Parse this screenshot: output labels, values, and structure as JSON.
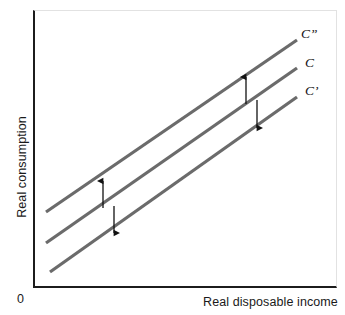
{
  "figure": {
    "origin_label": "0",
    "x_axis_title": "Real disposable income",
    "y_axis_title": "Real consumption"
  },
  "curve_labels": {
    "upper": "C”",
    "middle": "C",
    "lower": "C’"
  },
  "colors": {
    "curve": "#6b6b6b",
    "axis": "#1c1c1c",
    "arrow": "#111111",
    "frame_light": "#e2e2e2",
    "background": "#ffffff"
  },
  "chart_data": {
    "type": "line",
    "title": "",
    "xlabel": "Real disposable income",
    "ylabel": "Real consumption",
    "xlim": [
      0,
      100
    ],
    "ylim": [
      0,
      100
    ],
    "grid": false,
    "legend": "none",
    "axis_ticks": {
      "x": [],
      "y": [],
      "origin": "0"
    },
    "series": [
      {
        "name": "C”",
        "label": "C”",
        "description": "Upward-shifted consumption function",
        "color": "#6b6b6b",
        "points": [
          [
            4.3,
            27.0
          ],
          [
            86.8,
            89.2
          ]
        ],
        "pixel_points": [
          [
            46,
            212
          ],
          [
            297,
            40
          ]
        ]
      },
      {
        "name": "C",
        "label": "C",
        "description": "Baseline consumption function",
        "color": "#6b6b6b",
        "points": [
          [
            4.3,
            16.0
          ],
          [
            86.8,
            79.0
          ]
        ],
        "pixel_points": [
          [
            46,
            243
          ],
          [
            297,
            68
          ]
        ]
      },
      {
        "name": "C’",
        "label": "C’",
        "description": "Downward-shifted consumption function",
        "color": "#6b6b6b",
        "points": [
          [
            5.6,
            5.5
          ],
          [
            86.8,
            68.5
          ]
        ],
        "pixel_points": [
          [
            50,
            272
          ],
          [
            297,
            97
          ]
        ]
      }
    ],
    "annotations": [
      {
        "name": "upward-shift-arrow-left",
        "direction": "up",
        "meaning": "Shift from C to C”",
        "pixel_from": [
          103,
          208
        ],
        "pixel_to": [
          103,
          181
        ]
      },
      {
        "name": "downward-shift-arrow-left",
        "direction": "down",
        "meaning": "Shift from C to C’",
        "pixel_from": [
          114,
          206
        ],
        "pixel_to": [
          114,
          233
        ]
      },
      {
        "name": "upward-shift-arrow-right",
        "direction": "up",
        "meaning": "Shift from C to C”",
        "pixel_from": [
          246,
          104
        ],
        "pixel_to": [
          246,
          77
        ]
      },
      {
        "name": "downward-shift-arrow-right",
        "direction": "down",
        "meaning": "Shift from C to C’",
        "pixel_from": [
          257,
          100
        ],
        "pixel_to": [
          257,
          128
        ]
      }
    ]
  }
}
